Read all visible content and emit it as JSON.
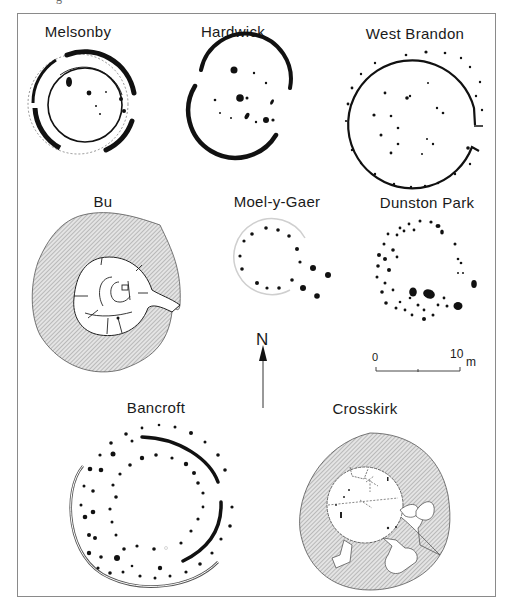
{
  "figure": {
    "caption_fragment": "g",
    "plans": [
      {
        "id": "melsonby",
        "label": "Melsonby"
      },
      {
        "id": "hardwick",
        "label": "Hardwick"
      },
      {
        "id": "west-brandon",
        "label": "West Brandon"
      },
      {
        "id": "bu",
        "label": "Bu"
      },
      {
        "id": "moel-y-gaer",
        "label": "Moel-y-Gaer"
      },
      {
        "id": "dunston-park",
        "label": "Dunston Park"
      },
      {
        "id": "bancroft",
        "label": "Bancroft"
      },
      {
        "id": "crosskirk",
        "label": "Crosskirk"
      }
    ],
    "north_arrow": {
      "label": "N"
    },
    "scale_bar": {
      "start": "0",
      "end": "10",
      "unit": "m"
    },
    "colors": {
      "ink": "#111111",
      "hatch": "#9a9a9a",
      "frame": "#8a8a8a",
      "faint": "#cfcfcf"
    }
  }
}
